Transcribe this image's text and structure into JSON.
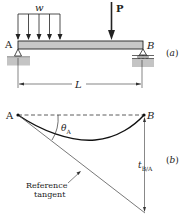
{
  "figure": {
    "part_a": {
      "tag": "(a)",
      "load_label": "w",
      "point_load_label": "P",
      "left_support_label": "A",
      "right_support_label": "B",
      "span_label": "L"
    },
    "part_b": {
      "tag": "(b)",
      "left_label": "A",
      "right_label": "B",
      "angle_label": "θ",
      "angle_subscript": "A",
      "deviation_label": "t",
      "deviation_subscript": "B/A",
      "tangent_label_line1": "Reference",
      "tangent_label_line2": "tangent"
    },
    "colors": {
      "beam_fill": "#c8c8c8",
      "ground_fill": "#c4c4c4",
      "line": "#222222",
      "thin_line": "#555555"
    }
  }
}
